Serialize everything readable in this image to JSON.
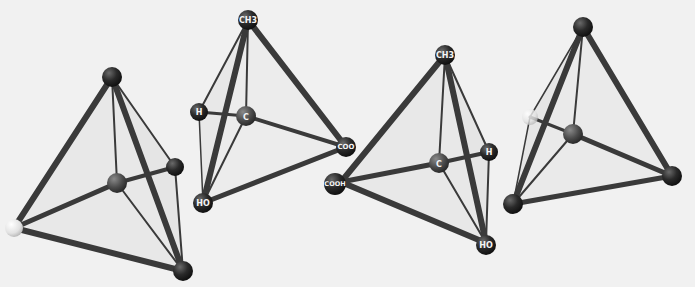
{
  "image": {
    "description": "Grayscale photograph of four ball-and-stick tetrahedral molecular models on a light background; the two central models are labeled mirror-image lactic acid enantiomers.",
    "background_color": "#f1f1f1",
    "stick_color": "#3a3a3a",
    "ball_color": "#262626",
    "light_ball_color": "#e6e6e6"
  },
  "models": [
    {
      "name": "unlabeled-tetrahedron-left",
      "labels": {
        "top": "",
        "center": "",
        "left": "",
        "right": "",
        "bottom": ""
      }
    },
    {
      "name": "lactic-acid-model-1",
      "labels": {
        "top": "CH3",
        "center": "C",
        "left": "H",
        "right": "COO",
        "bottom": "HO"
      }
    },
    {
      "name": "lactic-acid-model-2",
      "labels": {
        "top": "CH3",
        "center": "C",
        "left": "COOH",
        "right": "H",
        "bottom": "HO"
      }
    },
    {
      "name": "unlabeled-tetrahedron-right",
      "labels": {
        "top": "",
        "center": "",
        "left": "",
        "right": "",
        "bottom": ""
      }
    }
  ]
}
